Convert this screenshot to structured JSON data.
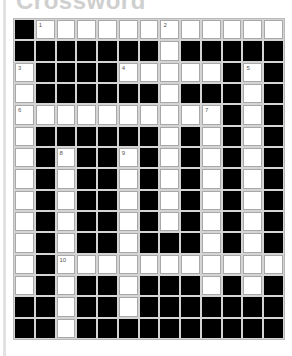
{
  "title": "Crossword",
  "grid": {
    "cols": 13,
    "rows": 15,
    "colors": {
      "block": "#000000",
      "open": "#ffffff",
      "gridline": "#d4d4d4"
    },
    "layout": [
      "#.......W....",
      "#######.#####",
      ".####.....#.#",
      ".######.###.#",
      "..........#.#",
      ".######.#.#.#",
      ".#.##.#.#.#.#",
      ".#.##.#.#.#.#",
      ".#.##.#.#.#.#",
      ".#.##.#.#.#.#",
      ".#.##.###.#.#",
      ".#...........",
      ".#.##.###.#.#",
      "##.##.#######",
      "##.##########"
    ],
    "numbers": [
      {
        "row": 0,
        "col": 1,
        "n": "1"
      },
      {
        "row": 0,
        "col": 7,
        "n": "2"
      },
      {
        "row": 2,
        "col": 0,
        "n": "3"
      },
      {
        "row": 2,
        "col": 5,
        "n": "4"
      },
      {
        "row": 2,
        "col": 11,
        "n": "5"
      },
      {
        "row": 4,
        "col": 0,
        "n": "6"
      },
      {
        "row": 4,
        "col": 9,
        "n": "7"
      },
      {
        "row": 6,
        "col": 2,
        "n": "8"
      },
      {
        "row": 6,
        "col": 5,
        "n": "9"
      },
      {
        "row": 11,
        "col": 2,
        "n": "10"
      }
    ]
  }
}
